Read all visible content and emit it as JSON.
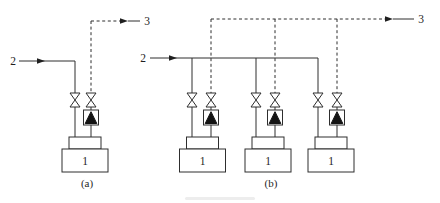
{
  "colors": {
    "background": "#ffffff",
    "line": "#2e2e2e",
    "relief_fill": "#141414",
    "text": "#1f1f1f"
  },
  "symbols": {
    "shutoff_valve": "gate-valve-icon",
    "relief_device": "relief-valve-icon",
    "flow_arrow": "flow-arrow-icon"
  },
  "diagram_a": {
    "caption": "(a)",
    "inlet_label": "2",
    "outlet_label": "3",
    "units": [
      {
        "label": "1"
      }
    ]
  },
  "diagram_b": {
    "caption": "(b)",
    "inlet_label": "2",
    "outlet_label": "3",
    "units": [
      {
        "label": "1"
      },
      {
        "label": "1"
      },
      {
        "label": "1"
      }
    ]
  }
}
